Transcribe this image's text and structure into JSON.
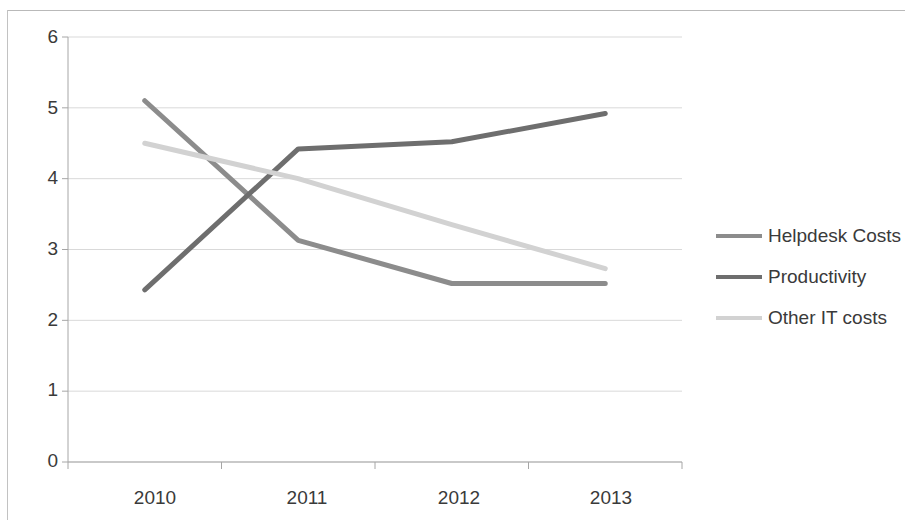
{
  "chart_data": {
    "type": "line",
    "title": "",
    "subtitle": "",
    "xlabel": "",
    "ylabel": "",
    "categories": [
      "2010",
      "2011",
      "2012",
      "2013"
    ],
    "x_tick_labels": [
      "2010",
      "2011",
      "2012",
      "2013"
    ],
    "y_tick_labels": [
      "0",
      "1",
      "2",
      "3",
      "4",
      "5",
      "6"
    ],
    "ylim": [
      0,
      6
    ],
    "y_tick_step": 1,
    "grid": "horizontal",
    "legend_position": "right",
    "series": [
      {
        "name": "Helpdesk Costs",
        "color": "#8c8c8c",
        "values": [
          5.1,
          3.13,
          2.52,
          2.52
        ]
      },
      {
        "name": "Productivity",
        "color": "#6e6e6e",
        "values": [
          2.43,
          4.42,
          4.52,
          4.92
        ]
      },
      {
        "name": "Other IT costs",
        "color": "#d2d2d2",
        "values": [
          4.5,
          4.0,
          3.35,
          2.73
        ]
      }
    ]
  },
  "axes": {
    "y_ticks": [
      "6",
      "5",
      "4",
      "3",
      "2",
      "1",
      "0"
    ],
    "x_ticks": [
      "2010",
      "2011",
      "2012",
      "2013"
    ]
  },
  "legend": {
    "items": [
      {
        "label": "Helpdesk Costs",
        "color": "#8c8c8c"
      },
      {
        "label": "Productivity",
        "color": "#6e6e6e"
      },
      {
        "label": "Other IT costs",
        "color": "#d2d2d2"
      }
    ]
  },
  "colors": {
    "frame_border": "#b9b9b9",
    "gridline": "#d9d9d9",
    "axis_line": "#a6a6a6",
    "tick_text": "#3a3a3a",
    "background": "#ffffff"
  }
}
